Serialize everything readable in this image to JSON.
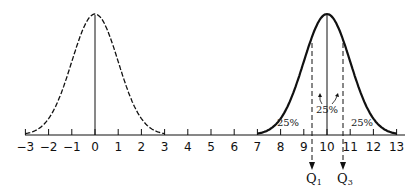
{
  "chart_data": {
    "type": "line",
    "title": "",
    "xlabel": "",
    "ylabel": "",
    "xlim": [
      -3,
      13
    ],
    "grid": false,
    "x_ticks": [
      -3,
      -2,
      -1,
      0,
      1,
      2,
      3,
      4,
      5,
      6,
      7,
      8,
      9,
      10,
      11,
      12,
      13
    ],
    "x_tick_labels": [
      "−3",
      "−2",
      "−1",
      "0",
      "1",
      "2",
      "3",
      "4",
      "5",
      "6",
      "7",
      "8",
      "9",
      "10",
      "11",
      "12",
      "13"
    ],
    "series": [
      {
        "name": "standard normal",
        "style": "dashed",
        "mean": 0,
        "sd": 1,
        "x_range": [
          -3,
          3
        ]
      },
      {
        "name": "normal mean 10",
        "style": "solid",
        "mean": 10,
        "sd": 1,
        "x_range": [
          7,
          13
        ]
      }
    ],
    "annotations": [
      {
        "text": "25%",
        "x": 8.7,
        "region": "left of Q1"
      },
      {
        "text": "25%",
        "x": 10,
        "region": "between Q1 and Q3 (split by mean)"
      },
      {
        "text": "25%",
        "x": 11.4,
        "region": "right of Q3"
      },
      {
        "text": "Q1",
        "x": 9.33
      },
      {
        "text": "Q3",
        "x": 10.67
      }
    ]
  },
  "labels": {
    "ticks": [
      "−3",
      "−2",
      "−1",
      "0",
      "1",
      "2",
      "3",
      "4",
      "5",
      "6",
      "7",
      "8",
      "9",
      "10",
      "11",
      "12",
      "13"
    ],
    "pct_left": "25%",
    "pct_center": "25%",
    "pct_right": "25%",
    "q1_main": "Q",
    "q1_sub": "1",
    "q3_main": "Q",
    "q3_sub": "3"
  }
}
